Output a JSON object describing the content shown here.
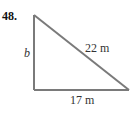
{
  "problem": {
    "number": "48."
  },
  "triangle": {
    "type": "right triangle",
    "line_color": "#7a7a7a",
    "sides": {
      "vertical_leg": "b",
      "hypotenuse": "22 m",
      "base": "17 m"
    }
  }
}
